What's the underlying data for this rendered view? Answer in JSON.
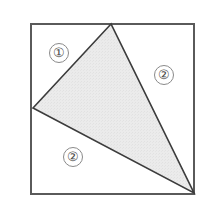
{
  "figure": {
    "background_color": "#ffffff",
    "square": {
      "name": "outer-square",
      "stroke_color": "#5a5a5a",
      "stroke_width": 1.5,
      "fill_color": "#ffffff",
      "left": 31,
      "top": 24,
      "right": 194,
      "bottom": 194,
      "width": 163,
      "height": 170
    },
    "triangle": {
      "name": "shaded-triangle",
      "stroke_color": "#3c3c3c",
      "stroke_width": 1.6,
      "fill_color": "#e9e9e9",
      "vertices": [
        {
          "label": "apex-top",
          "x": 111,
          "y": 24
        },
        {
          "label": "vertex-left",
          "x": 33,
          "y": 108
        },
        {
          "label": "vertex-bottom-right",
          "x": 194,
          "y": 193
        }
      ]
    },
    "region_labels": [
      {
        "name": "region-label-1",
        "text": "①",
        "value": "1",
        "x": 59,
        "y": 53
      },
      {
        "name": "region-label-2-right",
        "text": "②",
        "value": "2",
        "x": 164,
        "y": 75
      },
      {
        "name": "region-label-2-bottom",
        "text": "②",
        "value": "2",
        "x": 73,
        "y": 157
      }
    ]
  }
}
